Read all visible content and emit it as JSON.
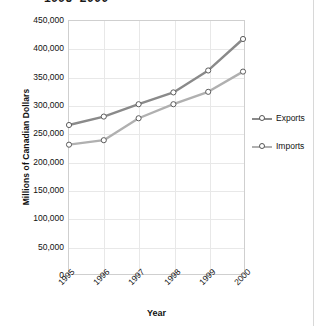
{
  "chart_title": "1995–2000",
  "axis": {
    "y_title": "Millions of Canadian Dollars",
    "x_title": "Year"
  },
  "legend": {
    "items": [
      {
        "label": "Exports",
        "color": "#8a8a8a"
      },
      {
        "label": "Imports",
        "color": "#b0b0b0"
      }
    ]
  },
  "yticks": [
    "450,000",
    "400,000",
    "350,000",
    "300,000",
    "250,000",
    "200,000",
    "150,000",
    "100,000",
    "50,000",
    "0"
  ],
  "xticks": [
    "1995",
    "1996",
    "1997",
    "1998",
    "1999",
    "2000"
  ],
  "chart_data": {
    "type": "line",
    "title": "1995–2000",
    "xlabel": "Year",
    "ylabel": "Millions of Canadian Dollars",
    "categories": [
      "1995",
      "1996",
      "1997",
      "1998",
      "1999",
      "2000"
    ],
    "ylim": [
      0,
      450000
    ],
    "ytick_step": 50000,
    "grid": true,
    "legend_position": "right",
    "series": [
      {
        "name": "Exports",
        "color": "#8a8a8a",
        "values": [
          265000,
          280000,
          302000,
          323000,
          362000,
          418000
        ]
      },
      {
        "name": "Imports",
        "color": "#b0b0b0",
        "values": [
          230000,
          238000,
          277000,
          302000,
          324000,
          360000
        ]
      }
    ]
  }
}
